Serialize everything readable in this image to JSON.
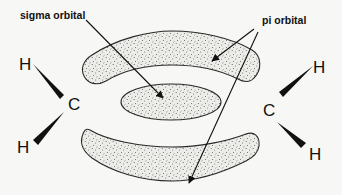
{
  "diagram": {
    "type": "molecular-orbital",
    "labels": {
      "sigma": "sigma orbital",
      "pi": "pi orbital"
    },
    "left_group": {
      "carbon": "C",
      "hydrogen_top": "H",
      "hydrogen_bottom": "H"
    },
    "right_group": {
      "carbon": "C",
      "hydrogen_top": "H",
      "hydrogen_bottom": "H"
    },
    "colors": {
      "background": "#f7f7f5",
      "outline": "#2a2a2a",
      "fill": "#e9e9e6",
      "stipple": "#555555",
      "text": "#111111"
    }
  }
}
